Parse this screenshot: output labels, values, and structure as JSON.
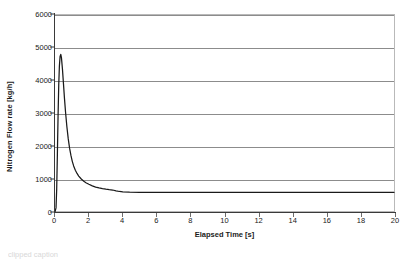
{
  "chart_data": {
    "type": "line",
    "title": "",
    "xlabel": "Elapsed Time [s]",
    "ylabel": "Nitrogen Flow rate [kg/h]",
    "xlim": [
      0,
      20
    ],
    "ylim": [
      0,
      6000
    ],
    "xticks": [
      0,
      2,
      4,
      6,
      8,
      10,
      12,
      14,
      16,
      18,
      20
    ],
    "yticks": [
      0,
      1000,
      2000,
      3000,
      4000,
      5000,
      6000
    ],
    "grid": "horizontal",
    "legend": "none",
    "line_color": "#1a1a1a",
    "grid_color": "#8c8c8c",
    "series": [
      {
        "name": "Nitrogen Flow rate",
        "x": [
          0.0,
          0.06,
          0.1,
          0.14,
          0.18,
          0.22,
          0.26,
          0.3,
          0.34,
          0.38,
          0.44,
          0.5,
          0.56,
          0.62,
          0.7,
          0.78,
          0.86,
          0.94,
          1.02,
          1.1,
          1.2,
          1.3,
          1.4,
          1.55,
          1.7,
          1.85,
          2.0,
          2.2,
          2.4,
          2.6,
          2.8,
          3.0,
          3.2,
          3.4,
          3.6,
          3.8,
          4.0,
          4.4,
          5.0,
          6.0,
          8.0,
          10.0,
          12.0,
          14.0,
          16.0,
          18.0,
          20.0
        ],
        "y": [
          0,
          120,
          700,
          1750,
          2900,
          3850,
          4450,
          4740,
          4800,
          4700,
          4350,
          3900,
          3450,
          3050,
          2600,
          2230,
          1940,
          1720,
          1540,
          1400,
          1270,
          1170,
          1090,
          1000,
          930,
          880,
          840,
          790,
          755,
          728,
          707,
          690,
          676,
          665,
          640,
          620,
          608,
          600,
          596,
          594,
          592,
          592,
          592,
          592,
          592,
          592,
          592
        ]
      }
    ],
    "annotations": {
      "peak_value": 4800,
      "peak_time": 0.34,
      "steady_state_value": 592
    }
  },
  "caption": {
    "text": "clipped caption"
  }
}
